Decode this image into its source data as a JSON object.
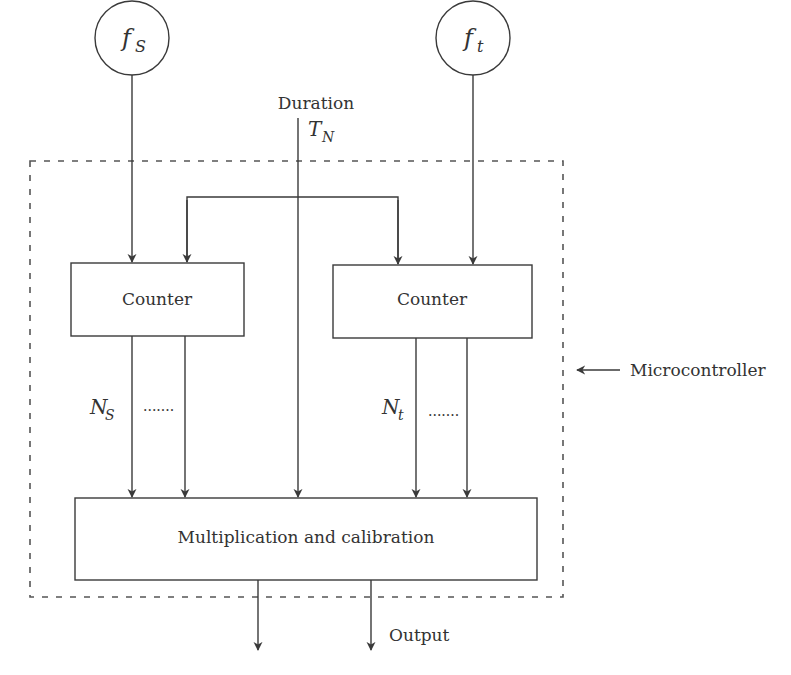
{
  "diagram": {
    "sources": [
      {
        "id": "fs",
        "symbol": "f",
        "subscript": "S"
      },
      {
        "id": "ft",
        "symbol": "f",
        "subscript": "t"
      }
    ],
    "duration": {
      "label": "Duration",
      "symbol": "T",
      "subscript": "N"
    },
    "blocks": {
      "counter_left": "Counter",
      "counter_right": "Counter",
      "multiplication": "Multiplication and calibration"
    },
    "counter_outputs": {
      "left": {
        "symbol": "N",
        "subscript": "S",
        "ellipsis": "......."
      },
      "right": {
        "symbol": "N",
        "subscript": "t",
        "ellipsis": "......."
      }
    },
    "boundary_label": "Microcontroller",
    "output_label": "Output"
  },
  "colors": {
    "stroke": "#3a3a3a",
    "dashed": "#555555",
    "text": "#333333"
  }
}
